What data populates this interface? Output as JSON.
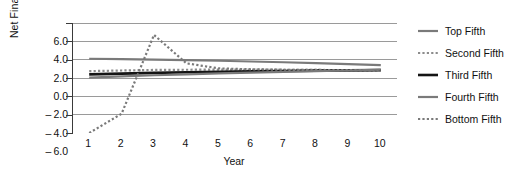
{
  "chart_data": {
    "type": "line",
    "title": "",
    "xlabel": "Year",
    "ylabel": "Net Financial Leverage",
    "x": [
      1,
      2,
      3,
      4,
      5,
      6,
      7,
      8,
      9,
      10
    ],
    "xlim": [
      0.5,
      10.5
    ],
    "ylim": [
      -6.0,
      6.0
    ],
    "yticks": [
      6.0,
      4.0,
      2.0,
      0.0,
      -2.0,
      -4.0,
      -6.0
    ],
    "ytick_labels": [
      "6.0",
      "4.0",
      "2.0",
      "0.0",
      "-2.0",
      "-4.0",
      "-6.0"
    ],
    "xtick_labels": [
      "1",
      "2",
      "3",
      "4",
      "5",
      "6",
      "7",
      "8",
      "9",
      "10"
    ],
    "grid": true,
    "grid_axis": "y",
    "legend_position": "right",
    "series": [
      {
        "name": "Top Fifth",
        "style": "solid",
        "color": "#7a7a7a",
        "width": 2.2,
        "values": [
          2.1,
          2.05,
          2.0,
          1.95,
          1.88,
          1.8,
          1.72,
          1.62,
          1.52,
          1.4
        ]
      },
      {
        "name": "Second Fifth",
        "style": "dotted",
        "color": "#8c8c8c",
        "width": 2.2,
        "values": [
          0.75,
          0.82,
          0.88,
          0.9,
          0.92,
          0.92,
          0.9,
          0.88,
          0.85,
          0.82
        ]
      },
      {
        "name": "Third Fifth",
        "style": "solid",
        "color": "#141414",
        "width": 2.6,
        "values": [
          0.4,
          0.48,
          0.56,
          0.62,
          0.68,
          0.72,
          0.76,
          0.8,
          0.83,
          0.86
        ]
      },
      {
        "name": "Fourth Fifth",
        "style": "solid",
        "color": "#7a7a7a",
        "width": 2.2,
        "values": [
          0.05,
          0.18,
          0.3,
          0.4,
          0.5,
          0.58,
          0.66,
          0.74,
          0.82,
          0.92
        ]
      },
      {
        "name": "Bottom Fifth",
        "style": "dotted",
        "color": "#7a7a7a",
        "width": 2.2,
        "values": [
          -6.0,
          -3.9,
          4.7,
          1.6,
          1.05,
          0.95,
          0.9,
          0.88,
          0.86,
          0.84
        ]
      }
    ]
  },
  "axes": {
    "y_title": "Net Financial Leverage",
    "x_title": "Year"
  },
  "legend": {
    "entries": [
      {
        "label": "Top Fifth"
      },
      {
        "label": "Second Fifth"
      },
      {
        "label": "Third Fifth"
      },
      {
        "label": "Fourth Fifth"
      },
      {
        "label": "Bottom Fifth"
      }
    ]
  },
  "colors": {
    "grid": "#9a9a9a",
    "axis": "#3a3a3a",
    "text": "#111111",
    "series_gray": "#7a7a7a",
    "series_black": "#141414",
    "background": "#ffffff"
  }
}
